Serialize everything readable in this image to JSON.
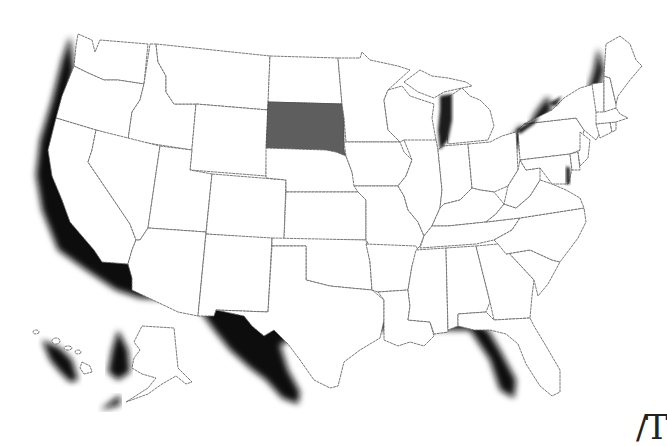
{
  "map": {
    "type": "choropleth",
    "region": "United States",
    "highlighted_states": [
      "South Dakota"
    ],
    "highlight_color": "#5e5e5e",
    "base_color": "#ffffff",
    "border_color": "#6a6a6a",
    "shadow_color": "#111111",
    "insets": [
      "Alaska",
      "Hawaii"
    ]
  },
  "corner_text": "/T"
}
